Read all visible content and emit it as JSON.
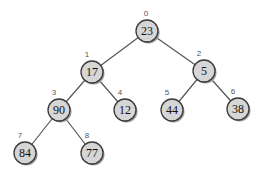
{
  "diagram": {
    "type": "binary-heap-tree",
    "nodes": [
      {
        "index": "0",
        "value": "23",
        "x": 147,
        "y": 31
      },
      {
        "index": "1",
        "value": "17",
        "x": 92,
        "y": 72
      },
      {
        "index": "2",
        "value": "5",
        "x": 204,
        "y": 71
      },
      {
        "index": "3",
        "value": "90",
        "x": 59,
        "y": 110
      },
      {
        "index": "4",
        "value": "12",
        "x": 125,
        "y": 110
      },
      {
        "index": "5",
        "value": "44",
        "x": 172,
        "y": 110
      },
      {
        "index": "6",
        "value": "38",
        "x": 238,
        "y": 109
      },
      {
        "index": "7",
        "value": "84",
        "x": 25,
        "y": 153
      },
      {
        "index": "8",
        "value": "77",
        "x": 92,
        "y": 153
      }
    ],
    "edges": [
      [
        0,
        1
      ],
      [
        0,
        2
      ],
      [
        1,
        3
      ],
      [
        1,
        4
      ],
      [
        2,
        5
      ],
      [
        2,
        6
      ],
      [
        3,
        7
      ],
      [
        3,
        8
      ]
    ],
    "colors": {
      "node_fill": "#d6d6d6",
      "node_stroke": "#3a3a3a",
      "edge": "#555555",
      "index_label": "#555555"
    }
  }
}
